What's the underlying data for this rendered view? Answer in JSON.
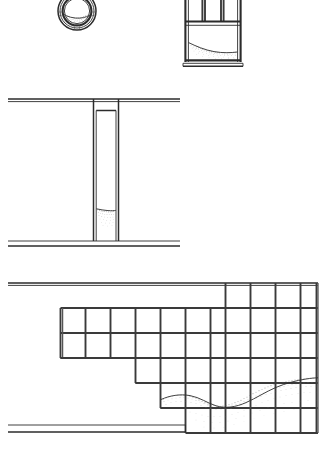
{
  "sheet": {
    "title": "Architectural elevation sheet",
    "background_color": "#ffffff",
    "ink_color": "#2b2b2b",
    "width": 324,
    "height": 458
  },
  "figures": [
    {
      "id": "oculus",
      "name": "round-window-oculus",
      "label": "",
      "type": "circular window elevation",
      "center": [
        77,
        11
      ],
      "outer_radius": 19,
      "inner_radius": 15,
      "deposit": "stippled sediment band across lower third"
    },
    {
      "id": "sash-window",
      "name": "sash-window-elevation",
      "label": "",
      "type": "window elevation with transom",
      "bounds": [
        184,
        -8,
        58,
        74
      ],
      "upper_lights": 3,
      "lower_lights": 1,
      "deposit": "stippled drift along sill sloping down to the right"
    },
    {
      "id": "pier-section",
      "name": "pier-opening-section",
      "label": "",
      "type": "wall section with narrow opening",
      "top_line_y": 99,
      "bottom_line_y": 241,
      "second_bottom_line_y": 246,
      "line_x_start": 8,
      "line_x_end": 180,
      "opening_bounds": [
        93,
        110,
        26,
        131
      ],
      "deposit": "stipple accumulation at base of opening"
    },
    {
      "id": "curtain-wall-grid",
      "name": "stepped-curtain-wall-grid",
      "label": "",
      "type": "gridded curtain wall elevation, stepped profile",
      "top_line_y": 283,
      "bottom_line_y": 425,
      "second_bottom_line_y": 432,
      "line_x_start": 8,
      "line_x_end": 318,
      "module_width": 25,
      "module_height": 25,
      "deposit": "undulating stippled drift crossing the lower bays"
    }
  ],
  "legend": {
    "stipple_meaning": "sand / sediment drift",
    "line_meaning": "building fabric in elevation"
  }
}
